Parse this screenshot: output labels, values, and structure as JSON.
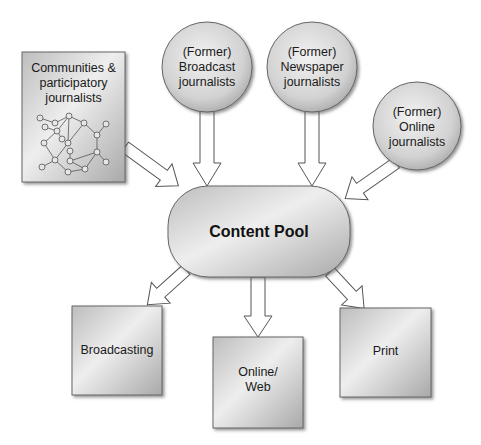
{
  "diagram": {
    "sources": {
      "communities": {
        "lines": [
          "Communities &",
          "participatory",
          "journalists"
        ]
      },
      "broadcast": {
        "lines": [
          "(Former)",
          "Broadcast",
          "journalists"
        ]
      },
      "newspaper": {
        "lines": [
          "(Former)",
          "Newspaper",
          "journalists"
        ]
      },
      "online": {
        "lines": [
          "(Former)",
          "Online",
          "journalists"
        ]
      }
    },
    "hub": {
      "label": "Content Pool"
    },
    "outputs": {
      "broadcasting": {
        "lines": [
          "Broadcasting"
        ]
      },
      "online_web": {
        "lines": [
          "Online/",
          "Web"
        ]
      },
      "print": {
        "lines": [
          "Print"
        ]
      }
    },
    "edges": [
      {
        "from": "Communities & participatory journalists",
        "to": "Content Pool"
      },
      {
        "from": "(Former) Broadcast journalists",
        "to": "Content Pool"
      },
      {
        "from": "(Former) Newspaper journalists",
        "to": "Content Pool"
      },
      {
        "from": "(Former) Online journalists",
        "to": "Content Pool"
      },
      {
        "from": "Content Pool",
        "to": "Broadcasting"
      },
      {
        "from": "Content Pool",
        "to": "Online/Web"
      },
      {
        "from": "Content Pool",
        "to": "Print"
      }
    ]
  }
}
